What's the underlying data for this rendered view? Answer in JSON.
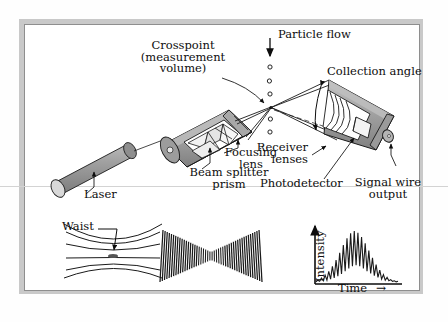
{
  "figure": {
    "type": "schematic-diagram"
  },
  "labels": {
    "crosspoint_line1": "Crosspoint",
    "crosspoint_line2": "(measurement",
    "crosspoint_line3": "volume)",
    "particle_flow": "Particle flow",
    "collection_angle": "Collection angle",
    "focusing_lens_line1": "Focusing",
    "focusing_lens_line2": "lens",
    "beam_splitter_line1": "Beam splitter",
    "beam_splitter_line2": "prism",
    "receiver_lenses_line1": "Receiver",
    "receiver_lenses_line2": "lenses",
    "photodetector": "Photodetector",
    "signal_wire_line1": "Signal wire",
    "signal_wire_line2": "output",
    "laser": "Laser",
    "waist": "Waist"
  },
  "insets": {
    "waist": {
      "name": "beam-waist-inset",
      "label": "Waist",
      "beam_count": 6
    },
    "fringes": {
      "name": "interference-fringe-inset",
      "fringe_count": 46
    },
    "signal": {
      "name": "doppler-burst-inset"
    }
  },
  "chart_data": {
    "type": "line",
    "title": "",
    "xlabel": "Time",
    "ylabel": "Intensity",
    "x_arrow": "→",
    "y_arrow": "↑",
    "grid": false,
    "legend": null,
    "xlim": [
      0,
      100
    ],
    "ylim": [
      0,
      100
    ],
    "series": [
      {
        "name": "Doppler burst signal",
        "envelope": "gaussian",
        "envelope_center": 50,
        "envelope_width": 22,
        "cycles": 17,
        "values": [
          2,
          5,
          3,
          9,
          4,
          14,
          5,
          21,
          7,
          30,
          9,
          41,
          12,
          54,
          16,
          68,
          21,
          80,
          26,
          89,
          30,
          93,
          32,
          90,
          30,
          82,
          26,
          71,
          21,
          58,
          17,
          45,
          13,
          33,
          10,
          23,
          7,
          15,
          5,
          10,
          4,
          6,
          3,
          4,
          2,
          3
        ]
      }
    ]
  },
  "colors": {
    "ink": "#0d0d0d",
    "housing_fill": "#9a9a9a",
    "housing_light": "#c2c2c2",
    "housing_dark": "#6f6f6f",
    "frame": "#8e8e8e",
    "mat": "#c9c9c9",
    "paper": "#ffffff"
  }
}
